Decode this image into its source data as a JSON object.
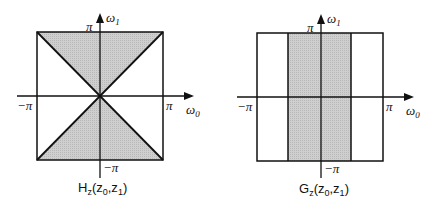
{
  "figure": {
    "panels": [
      {
        "id": "left",
        "caption": {
          "base": "H",
          "sub": "z",
          "open": "(z",
          "sub0": "0",
          "comma": ",z",
          "sub1": "1",
          "close": ")"
        },
        "axes": {
          "x_label": "ω",
          "x_label_sub": "0",
          "y_label": "ω",
          "y_label_sub": "1",
          "x_min_label": "−π",
          "x_max_label": "π",
          "y_min_label": "−π",
          "y_max_label": "π"
        },
        "region": "hourglass (|ω1| ≥ |ω0|) shaded",
        "fill_color": "#c8c8c8"
      },
      {
        "id": "right",
        "caption": {
          "base": "G",
          "sub": "z",
          "open": "(z",
          "sub0": "0",
          "comma": ",z",
          "sub1": "1",
          "close": ")"
        },
        "axes": {
          "x_label": "ω",
          "x_label_sub": "0",
          "y_label": "ω",
          "y_label_sub": "1",
          "x_min_label": "−π",
          "x_max_label": "π",
          "y_min_label": "−π",
          "y_max_label": "π"
        },
        "region": "vertical band (|ω0| ≤ π/2) shaded",
        "fill_color": "#c8c8c8"
      }
    ]
  }
}
